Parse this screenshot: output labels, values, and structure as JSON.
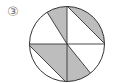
{
  "figure": {
    "label": "③",
    "colors": {
      "stroke": "#333333",
      "shade": "#bdbdbd",
      "background": "#ffffff"
    }
  }
}
